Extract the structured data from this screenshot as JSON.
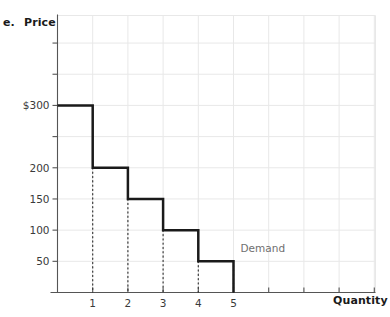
{
  "panel": {
    "letter": "e.",
    "series_label": "Demand"
  },
  "chart_data": {
    "type": "line",
    "subtype": "step-demand-curve",
    "title": "",
    "xlabel": "Quantity",
    "ylabel": "Price",
    "xlim": [
      0,
      10.5
    ],
    "ylim": [
      0,
      350
    ],
    "grid": true,
    "legend_position": "inline-right",
    "annotations": [
      {
        "text": "Demand",
        "x": 5.2,
        "y": 70
      }
    ],
    "y_ticks": [
      50,
      100,
      150,
      200,
      250,
      300
    ],
    "y_tick_labels": [
      "50",
      "100",
      "150",
      "200",
      "$300",
      ""
    ],
    "y_tick_labels_shown": [
      {
        "value": 50,
        "label": "50"
      },
      {
        "value": 100,
        "label": "100"
      },
      {
        "value": 150,
        "label": "150"
      },
      {
        "value": 200,
        "label": "200"
      },
      {
        "value": 300,
        "label": "$300"
      }
    ],
    "x_ticks": [
      1,
      2,
      3,
      4,
      5,
      6,
      7,
      8,
      9,
      10
    ],
    "x_tick_labels_shown": [
      {
        "value": 1,
        "label": "1"
      },
      {
        "value": 2,
        "label": "2"
      },
      {
        "value": 3,
        "label": "3"
      },
      {
        "value": 4,
        "label": "4"
      },
      {
        "value": 5,
        "label": "5"
      }
    ],
    "categories": [
      1,
      2,
      3,
      4,
      5
    ],
    "values": [
      300,
      200,
      150,
      100,
      50
    ],
    "steps": [
      {
        "quantity_from": 0,
        "quantity_to": 1,
        "price": 300
      },
      {
        "quantity_from": 1,
        "quantity_to": 2,
        "price": 200
      },
      {
        "quantity_from": 2,
        "quantity_to": 3,
        "price": 150
      },
      {
        "quantity_from": 3,
        "quantity_to": 4,
        "price": 100
      },
      {
        "quantity_from": 4,
        "quantity_to": 5,
        "price": 50
      }
    ],
    "drop_lines": [
      {
        "quantity": 1,
        "price": 200
      },
      {
        "quantity": 2,
        "price": 150
      },
      {
        "quantity": 3,
        "price": 100
      },
      {
        "quantity": 4,
        "price": 50
      },
      {
        "quantity": 5,
        "price": 50
      }
    ],
    "colors": {
      "curve": "#1a1a1a",
      "axis": "#555555",
      "grid": "#e8e8e8",
      "dropline": "#3a3a3a",
      "annotation": "#6f6f6f"
    }
  }
}
